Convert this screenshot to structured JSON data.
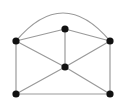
{
  "figure": {
    "type": "node-link-diagram",
    "background_color": "#ffffff",
    "width": 124,
    "height": 104
  },
  "style": {
    "edge_color": "#9a9a9a",
    "edge_width": 1.2,
    "vertex_color": "#111111",
    "vertex_radius": 3.6
  },
  "chart_data": {
    "type": "diagram",
    "title": "",
    "vertex_count": 6,
    "edge_count": 10,
    "vertices": [
      {
        "id": "v-top-mid",
        "label": "",
        "x": 65,
        "y": 29
      },
      {
        "id": "v-left",
        "label": "",
        "x": 16,
        "y": 41
      },
      {
        "id": "v-right",
        "label": "",
        "x": 110,
        "y": 41
      },
      {
        "id": "v-center",
        "label": "",
        "x": 65,
        "y": 67
      },
      {
        "id": "v-bottom-left",
        "label": "",
        "x": 16,
        "y": 94
      },
      {
        "id": "v-bottom-right",
        "label": "",
        "x": 110,
        "y": 94
      }
    ],
    "edges": [
      {
        "id": "e-left-right-arc",
        "from": "v-left",
        "to": "v-right",
        "shape": "arc",
        "apex_x": 63,
        "apex_y": 13
      },
      {
        "id": "e-left-topmid",
        "from": "v-left",
        "to": "v-top-mid",
        "shape": "straight"
      },
      {
        "id": "e-topmid-right",
        "from": "v-top-mid",
        "to": "v-right",
        "shape": "straight"
      },
      {
        "id": "e-topmid-center",
        "from": "v-top-mid",
        "to": "v-center",
        "shape": "straight"
      },
      {
        "id": "e-left-center",
        "from": "v-left",
        "to": "v-center",
        "shape": "straight"
      },
      {
        "id": "e-center-right",
        "from": "v-center",
        "to": "v-right",
        "shape": "straight"
      },
      {
        "id": "e-left-bottomleft",
        "from": "v-left",
        "to": "v-bottom-left",
        "shape": "straight"
      },
      {
        "id": "e-right-bottomright",
        "from": "v-right",
        "to": "v-bottom-right",
        "shape": "straight"
      },
      {
        "id": "e-center-bottomleft",
        "from": "v-center",
        "to": "v-bottom-left",
        "shape": "straight"
      },
      {
        "id": "e-center-bottomright",
        "from": "v-center",
        "to": "v-bottom-right",
        "shape": "straight"
      },
      {
        "id": "e-bottom-base",
        "from": "v-bottom-left",
        "to": "v-bottom-right",
        "shape": "straight"
      }
    ]
  }
}
